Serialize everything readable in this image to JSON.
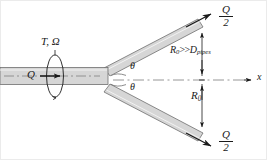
{
  "figure": {
    "colors": {
      "pipe_fill": "#d6d6d6",
      "pipe_wall": "#6f6f6f",
      "line": "#1a1a1a",
      "centerline": "#8a8a8a",
      "border": "#e6e6e6",
      "background": "#ffffff"
    }
  },
  "labels": {
    "torque_omega": "T, Ω",
    "inlet_flow": "Q",
    "angle_upper": "θ",
    "angle_lower": "θ",
    "axis_x": "x",
    "radius_condition_left": "R",
    "radius_condition_left_sub": "0",
    "radius_condition_op": ">>",
    "radius_condition_right": "D",
    "radius_condition_right_sub": "pipes",
    "radius": "R",
    "radius_sub": "0"
  },
  "fractions": {
    "upper_branch_flow": {
      "numerator": "Q",
      "denominator": "2"
    },
    "lower_branch_flow": {
      "numerator": "Q",
      "denominator": "2"
    }
  },
  "icons": {
    "flow_arrow": "flow-arrow-icon",
    "rotation_ellipse": "rotation-ellipse-icon",
    "axis_arrow": "axis-arrow-icon",
    "dimension_arrow": "dimension-arrow-icon"
  }
}
